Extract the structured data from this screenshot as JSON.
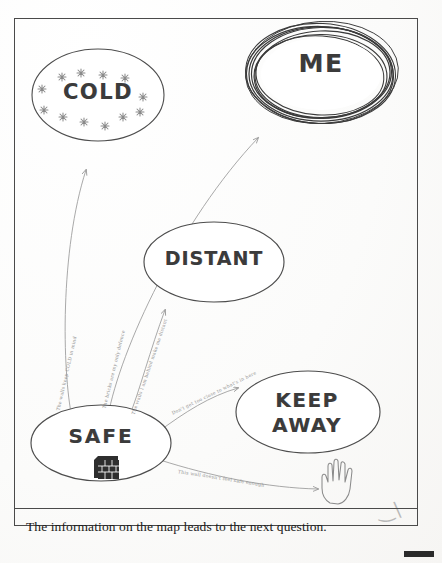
{
  "worksheet": {
    "caption": "The information on the map leads to the next question."
  },
  "nodes": [
    {
      "id": "cold",
      "label": "COLD",
      "icon": "snowflake-icon",
      "style": "plain-ellipse"
    },
    {
      "id": "me",
      "label": "ME",
      "icon": "none",
      "style": "scribbled-ellipse"
    },
    {
      "id": "distant",
      "label": "DISTANT",
      "icon": "none",
      "style": "plain-ellipse"
    },
    {
      "id": "safe",
      "label": "SAFE",
      "icon": "brick-wall-icon",
      "style": "plain-ellipse"
    },
    {
      "id": "keep_away",
      "label": "KEEP\nAWAY",
      "icon": "none",
      "style": "plain-ellipse"
    }
  ],
  "node_labels": {
    "cold": "COLD",
    "me": "ME",
    "distant": "DISTANT",
    "safe": "SAFE",
    "keep_away_line1": "KEEP",
    "keep_away_line2": "AWAY"
  },
  "connections": [
    {
      "id": "safe_to_cold",
      "from": "SAFE",
      "to": "COLD",
      "note": "The walls keep COLD in mind"
    },
    {
      "id": "safe_to_me",
      "from": "SAFE",
      "to": "ME",
      "note": "The bricks are my only defence"
    },
    {
      "id": "safe_to_distant",
      "from": "SAFE",
      "to": "DISTANT",
      "note": "The walls I am behind make me distant"
    },
    {
      "id": "safe_to_keep_away",
      "from": "SAFE",
      "to": "KEEP AWAY",
      "note": "Don't get too close to what's in here"
    },
    {
      "id": "safe_to_hand",
      "from": "SAFE",
      "to": "HAND",
      "note": "This wall doesn't feel safe enough"
    }
  ],
  "icons": {
    "brick_wall": "brick-wall-icon",
    "stop_hand": "stop-hand-icon",
    "snowflake": "snowflake-icon"
  },
  "colors": {
    "ink": "#3b3b3b",
    "pencil": "#8e8e8e",
    "frame": "#4a4a4a",
    "paper": "#fdfdfc",
    "caption": "#1a1a1a"
  }
}
